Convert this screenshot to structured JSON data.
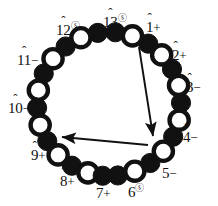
{
  "figure": {
    "type": "bead-ring-diagram",
    "width": 218,
    "height": 206,
    "background": "#ffffff",
    "ink": "#111111"
  },
  "chart_data": {
    "type": "scatter",
    "title": "",
    "xlabel": "",
    "ylabel": "",
    "center": {
      "x": 109,
      "y": 104
    },
    "radius": 72,
    "legend": {
      "filled": "black bead",
      "open": "white bead"
    },
    "beads": [
      {
        "index": 1,
        "angle": 277,
        "fill": "filled"
      },
      {
        "index": 2,
        "angle": 291,
        "fill": "open"
      },
      {
        "index": 3,
        "angle": 305,
        "fill": "filled"
      },
      {
        "index": 4,
        "angle": 319,
        "fill": "open"
      },
      {
        "index": 5,
        "angle": 333,
        "fill": "filled"
      },
      {
        "index": 6,
        "angle": 347,
        "fill": "open"
      },
      {
        "index": 7,
        "angle": 1,
        "fill": "filled"
      },
      {
        "index": 8,
        "angle": 15,
        "fill": "open"
      },
      {
        "index": 9,
        "angle": 29,
        "fill": "filled"
      },
      {
        "index": 10,
        "angle": 43,
        "fill": "open"
      },
      {
        "index": 11,
        "angle": 57,
        "fill": "filled"
      },
      {
        "index": 12,
        "angle": 71,
        "fill": "open"
      },
      {
        "index": 13,
        "angle": 85,
        "fill": "filled"
      },
      {
        "index": 14,
        "angle": 99,
        "fill": "filled"
      },
      {
        "index": 15,
        "angle": 113,
        "fill": "open"
      },
      {
        "index": 16,
        "angle": 127,
        "fill": "filled"
      },
      {
        "index": 17,
        "angle": 141,
        "fill": "open"
      },
      {
        "index": 18,
        "angle": 155,
        "fill": "filled"
      },
      {
        "index": 19,
        "angle": 169,
        "fill": "open"
      },
      {
        "index": 20,
        "angle": 183,
        "fill": "filled"
      },
      {
        "index": 21,
        "angle": 197,
        "fill": "open"
      },
      {
        "index": 22,
        "angle": 211,
        "fill": "filled"
      },
      {
        "index": 23,
        "angle": 225,
        "fill": "open"
      },
      {
        "index": 24,
        "angle": 239,
        "fill": "filled"
      },
      {
        "index": 25,
        "angle": 253,
        "fill": "open"
      },
      {
        "index": 26,
        "angle": 265,
        "fill": "filled"
      }
    ],
    "labels": [
      {
        "id": "1",
        "number": "1",
        "sign": "+",
        "superscript": "",
        "hat": true,
        "x": 146,
        "y": 20
      },
      {
        "id": "2",
        "number": "2",
        "sign": "+",
        "superscript": "",
        "hat": true,
        "x": 172,
        "y": 48
      },
      {
        "id": "3",
        "number": "3",
        "sign": "−",
        "superscript": "",
        "hat": true,
        "x": 186,
        "y": 80
      },
      {
        "id": "4",
        "number": "4",
        "sign": "−",
        "superscript": "",
        "hat": true,
        "x": 183,
        "y": 130
      },
      {
        "id": "5",
        "number": "5",
        "sign": "−",
        "superscript": "",
        "hat": true,
        "x": 162,
        "y": 166
      },
      {
        "id": "6",
        "number": "6",
        "sign": "",
        "superscript": "ⓢ",
        "hat": true,
        "x": 128,
        "y": 184
      },
      {
        "id": "7",
        "number": "7",
        "sign": "+",
        "superscript": "",
        "hat": true,
        "x": 96,
        "y": 186
      },
      {
        "id": "8",
        "number": "8",
        "sign": "+",
        "superscript": "",
        "hat": true,
        "x": 60,
        "y": 174
      },
      {
        "id": "9",
        "number": "9",
        "sign": "+",
        "superscript": "",
        "hat": true,
        "x": 31,
        "y": 148
      },
      {
        "id": "10",
        "number": "10",
        "sign": "−",
        "superscript": "",
        "hat": true,
        "x": 8,
        "y": 101
      },
      {
        "id": "11",
        "number": "11",
        "sign": "−",
        "superscript": "",
        "hat": true,
        "x": 17,
        "y": 53
      },
      {
        "id": "12",
        "number": "12",
        "sign": "",
        "superscript": "ⓢ",
        "hat": true,
        "x": 56,
        "y": 22
      },
      {
        "id": "13",
        "number": "13",
        "sign": "",
        "superscript": "ⓢ",
        "hat": true,
        "x": 103,
        "y": 14
      }
    ],
    "arrows": [
      {
        "id": "arrow-diagonal",
        "from": {
          "x": 139,
          "y": 47
        },
        "to": {
          "x": 153,
          "y": 136
        }
      },
      {
        "id": "arrow-horizontal",
        "from": {
          "x": 148,
          "y": 145
        },
        "to": {
          "x": 62,
          "y": 137
        }
      }
    ]
  }
}
